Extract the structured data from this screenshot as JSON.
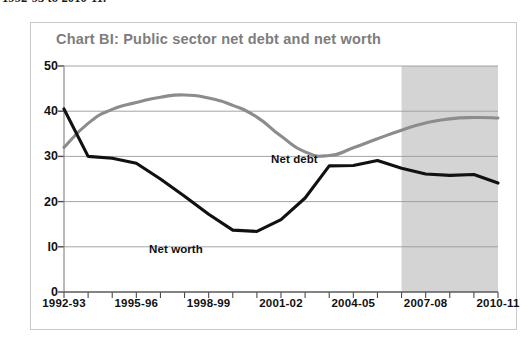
{
  "caption": {
    "text": "1992-93 to 2010-11."
  },
  "figure": {
    "title": "Chart BI: Public sector net debt and net worth",
    "title_color": "#7d7d7d",
    "border_color": "#c9c9c9"
  },
  "chart_data": {
    "type": "line",
    "title": "Chart BI: Public sector net debt and net worth",
    "xlabel": "",
    "ylabel": "",
    "ylim": [
      0,
      50
    ],
    "ytick_values": [
      0,
      10,
      20,
      30,
      40,
      50
    ],
    "ytick_labels": [
      "0",
      "l0",
      "20",
      "30",
      "40",
      "50"
    ],
    "grid": true,
    "grid_color": "#9a9a9a",
    "legend": "inline-annotation",
    "x_categories": [
      "1992-93",
      "1993-94",
      "1994-95",
      "1995-96",
      "1996-97",
      "1997-98",
      "1998-99",
      "1999-00",
      "2000-01",
      "2001-02",
      "2002-03",
      "2003-04",
      "2004-05",
      "2005-06",
      "2006-07",
      "2007-08",
      "2008-09",
      "2009-10",
      "2010-11"
    ],
    "xtick_labels": [
      "1992-93",
      "1995-96",
      "1998-99",
      "2001-02",
      "2004-05",
      "2007-08",
      "2010-11"
    ],
    "xtick_label_indices": [
      0,
      3,
      6,
      9,
      12,
      15,
      18
    ],
    "series": [
      {
        "name": "Net debt",
        "color": "#8c8c8c",
        "label": "Net debt",
        "values": [
          32.0,
          37.3,
          40.4,
          41.9,
          43.1,
          43.6,
          42.9,
          41.3,
          38.7,
          34.5,
          31.0,
          30.2,
          31.9,
          33.9,
          35.8,
          37.4,
          38.3,
          38.6,
          38.5
        ]
      },
      {
        "name": "Net worth",
        "color": "#111111",
        "label": "Net worth",
        "values": [
          40.5,
          30.0,
          29.6,
          28.5,
          25.0,
          21.2,
          17.2,
          13.7,
          13.4,
          16.0,
          20.8,
          27.9,
          28.0,
          29.1,
          27.4,
          26.1,
          25.8,
          26.0,
          24.1
        ]
      }
    ],
    "shaded_region": {
      "label": "projection",
      "color": "#d4d4d4",
      "start_category": "2006-07",
      "end_category": "2010-11"
    }
  }
}
